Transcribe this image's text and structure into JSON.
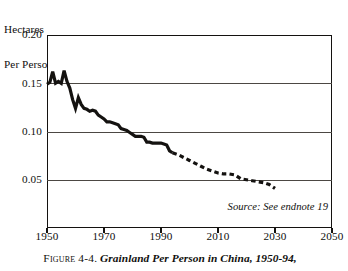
{
  "figure": {
    "caption_label": "Figure 4-4.",
    "caption_title": "Grainland Per Person in China, 1950-94,",
    "source_note": "Source: See endnote 19",
    "axis_unit_line1": "Hectares",
    "axis_unit_line2": "Per Person"
  },
  "chart_data": {
    "type": "line",
    "title": "Grainland Per Person in China, 1950-94,",
    "xlabel": "",
    "ylabel": "Hectares Per Person",
    "xlim": [
      1950,
      2050
    ],
    "ylim": [
      0,
      0.2
    ],
    "grid": true,
    "grid_axis": "y",
    "legend": "none",
    "annotations": [
      "Source: See endnote 19"
    ],
    "xticks": [
      1950,
      1970,
      1990,
      2010,
      2030,
      2050
    ],
    "xtick_labels": [
      "1950",
      "1970",
      "1990",
      "2010",
      "2030",
      "2050"
    ],
    "yticks": [
      0.05,
      0.1,
      0.15,
      0.2
    ],
    "ytick_labels": [
      "0.05",
      "0.10",
      "0.15",
      "0.20"
    ],
    "series": [
      {
        "name": "Historical grainland per person",
        "style": "solid",
        "color": "#141210",
        "x": [
          1950,
          1951,
          1952,
          1953,
          1954,
          1955,
          1956,
          1957,
          1958,
          1959,
          1960,
          1961,
          1962,
          1963,
          1964,
          1965,
          1966,
          1967,
          1968,
          1969,
          1970,
          1971,
          1972,
          1973,
          1974,
          1975,
          1976,
          1977,
          1978,
          1979,
          1980,
          1981,
          1982,
          1983,
          1984,
          1985,
          1986,
          1987,
          1988,
          1989,
          1990,
          1991,
          1992,
          1993,
          1994
        ],
        "y": [
          0.149,
          0.151,
          0.162,
          0.15,
          0.152,
          0.15,
          0.163,
          0.152,
          0.145,
          0.133,
          0.124,
          0.135,
          0.128,
          0.124,
          0.123,
          0.121,
          0.122,
          0.121,
          0.117,
          0.115,
          0.113,
          0.11,
          0.11,
          0.109,
          0.108,
          0.107,
          0.103,
          0.102,
          0.101,
          0.099,
          0.097,
          0.095,
          0.095,
          0.095,
          0.094,
          0.089,
          0.089,
          0.088,
          0.088,
          0.088,
          0.088,
          0.087,
          0.086,
          0.08,
          0.078
        ]
      },
      {
        "name": "Projected grainland per person",
        "style": "dashed",
        "color": "#141210",
        "x": [
          1994,
          1996,
          1998,
          2000,
          2002,
          2004,
          2006,
          2008,
          2010,
          2012,
          2014,
          2016,
          2018,
          2020,
          2022,
          2024,
          2026,
          2028,
          2030
        ],
        "y": [
          0.078,
          0.076,
          0.073,
          0.07,
          0.067,
          0.064,
          0.061,
          0.059,
          0.057,
          0.056,
          0.056,
          0.055,
          0.051,
          0.05,
          0.049,
          0.048,
          0.047,
          0.045,
          0.041
        ]
      }
    ]
  }
}
